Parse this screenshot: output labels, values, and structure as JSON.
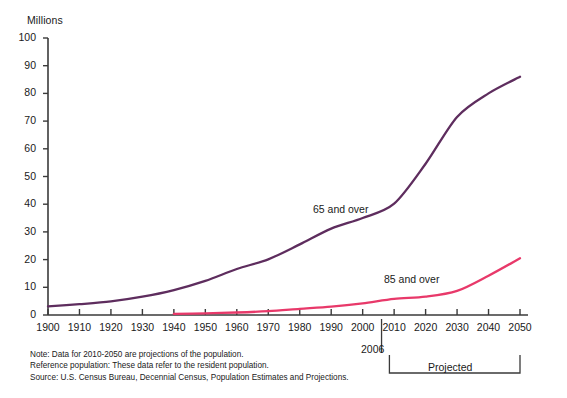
{
  "chart_data": {
    "type": "line",
    "title": "",
    "ylabel": "Millions",
    "xlabel": "",
    "ylim": [
      0,
      100
    ],
    "xlim": [
      1900,
      2050
    ],
    "grid": false,
    "legend_position": "inline-annotation",
    "x": [
      1900,
      1910,
      1920,
      1930,
      1940,
      1950,
      1960,
      1970,
      1980,
      1990,
      2000,
      2010,
      2020,
      2030,
      2040,
      2050
    ],
    "series": [
      {
        "name": "65 and over",
        "color": "#5e2d5e",
        "values": [
          3.1,
          3.9,
          4.9,
          6.6,
          9.0,
          12.3,
          16.6,
          20.1,
          25.5,
          31.2,
          35.0,
          40.2,
          54.6,
          71.5,
          80.0,
          86.0
        ]
      },
      {
        "name": "85 and over",
        "color": "#e8396a",
        "values": [
          null,
          null,
          null,
          null,
          0.4,
          0.6,
          0.9,
          1.4,
          2.2,
          3.0,
          4.2,
          5.8,
          6.6,
          8.7,
          14.2,
          20.5
        ]
      }
    ],
    "ytick_labels": [
      "100",
      "90",
      "80",
      "70",
      "60",
      "50",
      "40",
      "30",
      "20",
      "10",
      "0"
    ],
    "xtick_labels": [
      "1900",
      "1910",
      "1920",
      "1930",
      "1940",
      "1950",
      "1960",
      "1970",
      "1980",
      "1990",
      "2000",
      "2010",
      "2020",
      "2030",
      "2040",
      "2050"
    ],
    "annotations": {
      "series_label_65": "65 and over",
      "series_label_85": "85 and over",
      "divider_year": "2006",
      "projected_label": "Projected"
    }
  },
  "footnotes": {
    "note": "Note: Data for 2010-2050 are projections of the population.",
    "reference": "Reference population: These data refer to the resident population.",
    "source": "Source: U.S. Census Bureau, Decennial Census, Population Estimates and Projections."
  },
  "colors": {
    "series_65": "#5e2d5e",
    "series_85": "#e8396a",
    "axis": "#3a3a3a",
    "text": "#1a1a1a",
    "background": "#ffffff"
  }
}
